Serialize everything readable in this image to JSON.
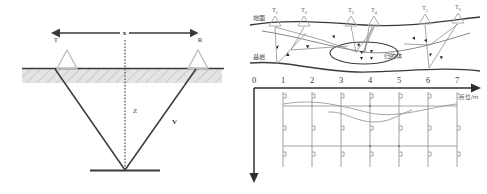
{
  "figure": {
    "name": "seismic-refraction-survey-figure",
    "panels": [
      {
        "id": "left",
        "name": "cross-hole-travel-path-diagram",
        "labels": {
          "transmitter": "T",
          "receiver": "R",
          "distance": "x",
          "depth": "Z",
          "velocity": "V"
        },
        "elements": {
          "surface_layer_name": "hatched-weathered-layer",
          "reflector_name": "reflector-interface",
          "raypath_name": "ray-path"
        }
      },
      {
        "id": "right",
        "name": "shallow-seismic-profile-and-grid-diagram",
        "labels": {
          "ground_surface": "地面",
          "bedrock": "基岩",
          "anomaly_body": "归的体",
          "axis_unit": "点位/m"
        },
        "shot_points": [
          {
            "label": "T",
            "sub": "1"
          },
          {
            "label": "T",
            "sub": "2"
          },
          {
            "label": "T",
            "sub": "3"
          },
          {
            "label": "T",
            "sub": "4"
          },
          {
            "label": "T",
            "sub": "5"
          },
          {
            "label": "T",
            "sub": "6"
          }
        ],
        "axis_ticks": [
          "0",
          "1",
          "2",
          "3",
          "4",
          "5",
          "6",
          "7"
        ],
        "depth_axis_origin": "0"
      }
    ],
    "colors": {
      "line": "#3a3a3a",
      "light_line": "#8d8d8d",
      "hatch_fill": "#e2e2e2",
      "background": "#ffffff",
      "text": "#3a3a3a"
    }
  }
}
